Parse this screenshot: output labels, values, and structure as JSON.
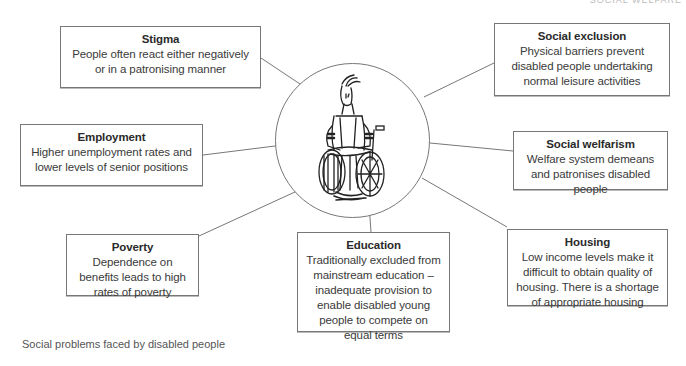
{
  "header": {
    "running_head": "SOCIAL WELFARE"
  },
  "hub": {
    "illustration": "person-in-wheelchair-sketch"
  },
  "nodes": [
    {
      "id": "stigma",
      "title": "Stigma",
      "desc": "People often react either negatively or in a patronising manner"
    },
    {
      "id": "social-exclusion",
      "title": "Social exclusion",
      "desc": "Physical barriers prevent disabled people undertaking normal leisure activities"
    },
    {
      "id": "employment",
      "title": "Employment",
      "desc": "Higher unemployment rates and lower levels of senior positions"
    },
    {
      "id": "social-welfarism",
      "title": "Social welfarism",
      "desc": "Welfare system demeans and patronises disabled people"
    },
    {
      "id": "poverty",
      "title": "Poverty",
      "desc": "Dependence on benefits leads to high rates of poverty"
    },
    {
      "id": "education",
      "title": "Education",
      "desc": "Traditionally excluded from mainstream education – inadequate provision to enable disabled young people to compete on equal terms"
    },
    {
      "id": "housing",
      "title": "Housing",
      "desc": "Low income levels make it difficult to obtain quality of housing. There is a shortage of appropriate housing"
    }
  ],
  "caption": "Social problems faced by disabled people",
  "colors": {
    "line": "#777777",
    "text": "#333333",
    "border": "#777777"
  }
}
